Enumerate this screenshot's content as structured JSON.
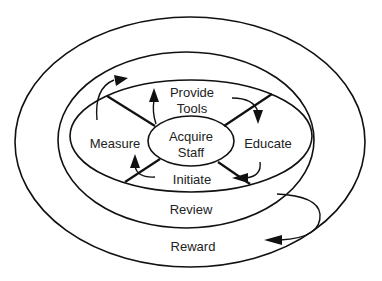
{
  "diagram": {
    "type": "concentric-cycle",
    "stroke_color": "#111111",
    "background": "#ffffff",
    "rings": {
      "outer": "Reward",
      "middle": "Review",
      "inner_segments": {
        "top_line1": "Provide",
        "top_line2": "Tools",
        "right": "Educate",
        "bottom": "Initiate",
        "left": "Measure"
      },
      "center_line1": "Acquire",
      "center_line2": "Staff"
    },
    "flow": [
      "Acquire Staff",
      "Provide Tools",
      "Educate",
      "Initiate",
      "Measure",
      "Review",
      "Reward"
    ],
    "icons": [
      "arrow-icon",
      "arrow-icon",
      "arrow-icon",
      "arrow-icon",
      "arrow-icon",
      "arrow-icon"
    ]
  }
}
